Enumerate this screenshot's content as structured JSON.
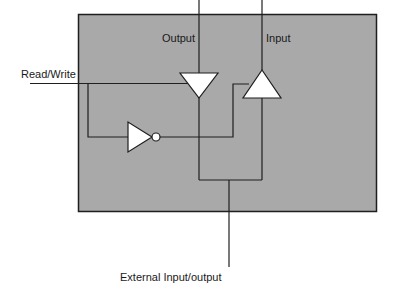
{
  "diagram": {
    "colors": {
      "box_fill": "#a9a9a9",
      "stroke": "#1f1f1f",
      "gate_fill": "#ffffff",
      "background": "#ffffff"
    },
    "labels": {
      "output": "Output",
      "input": "Input",
      "read_write": "Read/Write",
      "external": "External Input/output"
    },
    "components": [
      {
        "id": "output-buffer",
        "type": "tri-state buffer",
        "direction": "down"
      },
      {
        "id": "input-buffer",
        "type": "tri-state buffer",
        "direction": "up"
      },
      {
        "id": "inverter",
        "type": "NOT gate",
        "direction": "right"
      }
    ]
  }
}
